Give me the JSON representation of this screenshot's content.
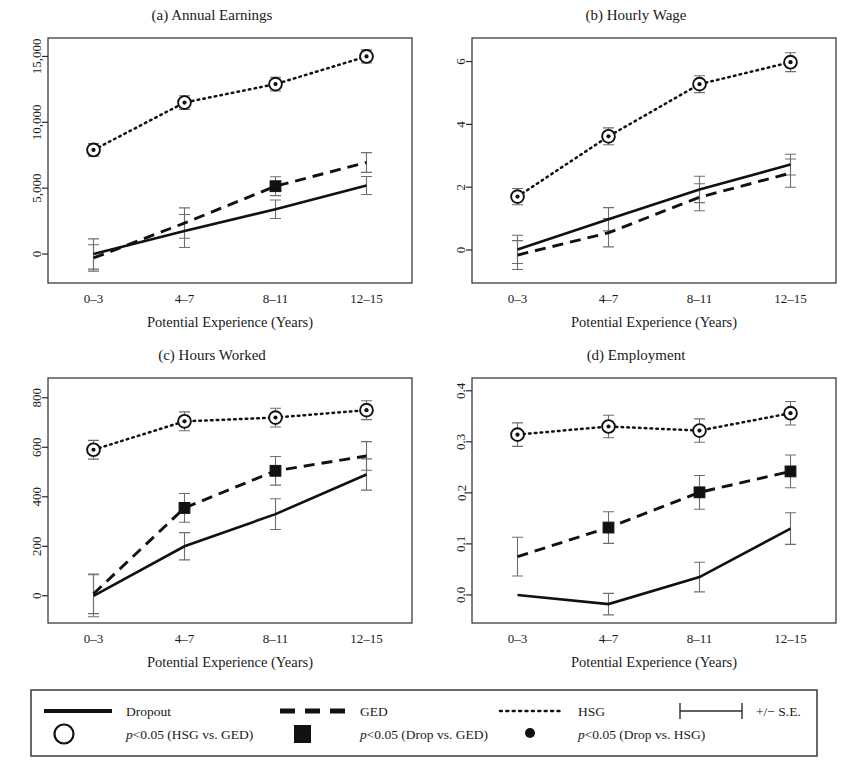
{
  "figure": {
    "xlabel": "Potential Experience (Years)",
    "categories": [
      "0–3",
      "4–7",
      "8–11",
      "12–15"
    ]
  },
  "legend": {
    "row1": [
      {
        "key": "dropout",
        "marker": "solid-line",
        "label": "Dropout"
      },
      {
        "key": "ged",
        "marker": "dashed-line",
        "label": "GED"
      },
      {
        "key": "hsg",
        "marker": "dotted-line",
        "label": "HSG"
      },
      {
        "key": "se",
        "marker": "error-bar",
        "label": "+/− S.E."
      }
    ],
    "row2": [
      {
        "key": "sig-hsg-ged",
        "marker": "open-circle",
        "label_p": "p",
        "label": "<0.05 (HSG vs. GED)"
      },
      {
        "key": "sig-drop-ged",
        "marker": "filled-square",
        "label_p": "p",
        "label": "<0.05 (Drop vs. GED)"
      },
      {
        "key": "sig-drop-hsg",
        "marker": "filled-dot",
        "label_p": "p",
        "label": "<0.05 (Drop vs. HSG)"
      }
    ]
  },
  "chart_data": [
    {
      "id": "a",
      "type": "line",
      "title": "(a) Annual Earnings",
      "xlabel": "Potential Experience (Years)",
      "ylabel": "",
      "categories": [
        "0–3",
        "4–7",
        "8–11",
        "12–15"
      ],
      "yticks": [
        0,
        5000,
        10000,
        15000
      ],
      "yticklabels": [
        "0",
        "5,000",
        "10,000",
        "15,000"
      ],
      "ylim": [
        -2200,
        16400
      ],
      "grid": false,
      "series": [
        {
          "name": "Dropout",
          "style": "solid",
          "values": [
            0,
            1750,
            3400,
            5200
          ],
          "se": [
            1150,
            1250,
            700,
            680
          ],
          "sig": [
            false,
            false,
            false,
            false
          ]
        },
        {
          "name": "GED",
          "style": "dashed",
          "values": [
            -300,
            2350,
            5150,
            6950
          ],
          "se": [
            1000,
            1150,
            720,
            750
          ],
          "sig": [
            false,
            false,
            "square",
            false
          ]
        },
        {
          "name": "HSG",
          "style": "dotted",
          "values": [
            7900,
            11500,
            12900,
            15000
          ],
          "se": [
            480,
            520,
            520,
            500
          ],
          "sig": [
            "circle",
            "circle",
            "circle",
            "circle"
          ]
        }
      ]
    },
    {
      "id": "b",
      "type": "line",
      "title": "(b) Hourly Wage",
      "xlabel": "Potential Experience (Years)",
      "ylabel": "",
      "categories": [
        "0–3",
        "4–7",
        "8–11",
        "12–15"
      ],
      "yticks": [
        0,
        2,
        4,
        6
      ],
      "yticklabels": [
        "0",
        "2",
        "4",
        "6"
      ],
      "ylim": [
        -1.05,
        6.75
      ],
      "grid": false,
      "series": [
        {
          "name": "Dropout",
          "style": "solid",
          "values": [
            0.02,
            0.98,
            1.93,
            2.72
          ],
          "se": [
            0.45,
            0.37,
            0.42,
            0.33
          ],
          "sig": [
            false,
            false,
            false,
            false
          ]
        },
        {
          "name": "GED",
          "style": "dashed",
          "values": [
            -0.16,
            0.55,
            1.68,
            2.45
          ],
          "se": [
            0.46,
            0.45,
            0.43,
            0.45
          ],
          "sig": [
            false,
            false,
            false,
            false
          ]
        },
        {
          "name": "HSG",
          "style": "dotted",
          "values": [
            1.7,
            3.62,
            5.28,
            5.98
          ],
          "se": [
            0.26,
            0.27,
            0.27,
            0.3
          ],
          "sig": [
            "circle",
            "circle",
            "circle",
            "circle"
          ]
        }
      ]
    },
    {
      "id": "c",
      "type": "line",
      "title": "(c) Hours Worked",
      "xlabel": "Potential Experience (Years)",
      "ylabel": "",
      "categories": [
        "0–3",
        "4–7",
        "8–11",
        "12–15"
      ],
      "yticks": [
        0,
        200,
        400,
        600,
        800
      ],
      "yticklabels": [
        "0",
        "200",
        "400",
        "600",
        "800"
      ],
      "ylim": [
        -110,
        880
      ],
      "grid": false,
      "series": [
        {
          "name": "Dropout",
          "style": "solid",
          "values": [
            0,
            200,
            330,
            490
          ],
          "se": [
            85,
            55,
            62,
            63
          ],
          "sig": [
            false,
            false,
            false,
            false
          ]
        },
        {
          "name": "GED",
          "style": "dashed",
          "values": [
            8,
            355,
            505,
            565
          ],
          "se": [
            80,
            58,
            58,
            58
          ],
          "sig": [
            false,
            "square",
            "square",
            false
          ]
        },
        {
          "name": "HSG",
          "style": "dotted",
          "values": [
            590,
            705,
            720,
            750
          ],
          "se": [
            38,
            38,
            38,
            38
          ],
          "sig": [
            "circle",
            "circle",
            "circle",
            "circle"
          ]
        }
      ]
    },
    {
      "id": "d",
      "type": "line",
      "title": "(d) Employment",
      "xlabel": "Potential Experience (Years)",
      "ylabel": "",
      "categories": [
        "0–3",
        "4–7",
        "8–11",
        "12–15"
      ],
      "yticks": [
        0.0,
        0.1,
        0.2,
        0.3,
        0.4
      ],
      "yticklabels": [
        "0.0",
        "0.1",
        "0.2",
        "0.3",
        "0.4"
      ],
      "ylim": [
        -0.055,
        0.425
      ],
      "grid": false,
      "series": [
        {
          "name": "Dropout",
          "style": "solid",
          "values": [
            0.0,
            -0.018,
            0.035,
            0.13
          ],
          "se": [
            0.0,
            0.021,
            0.029,
            0.031
          ],
          "sig": [
            false,
            false,
            false,
            false
          ]
        },
        {
          "name": "GED",
          "style": "dashed",
          "values": [
            0.075,
            0.132,
            0.201,
            0.242
          ],
          "se": [
            0.038,
            0.031,
            0.033,
            0.032
          ],
          "sig": [
            false,
            "square",
            "square",
            "square"
          ]
        },
        {
          "name": "HSG",
          "style": "dotted",
          "values": [
            0.314,
            0.33,
            0.322,
            0.356
          ],
          "se": [
            0.023,
            0.022,
            0.023,
            0.023
          ],
          "sig": [
            "circle",
            "circle",
            "circle",
            "circle"
          ]
        }
      ]
    }
  ]
}
